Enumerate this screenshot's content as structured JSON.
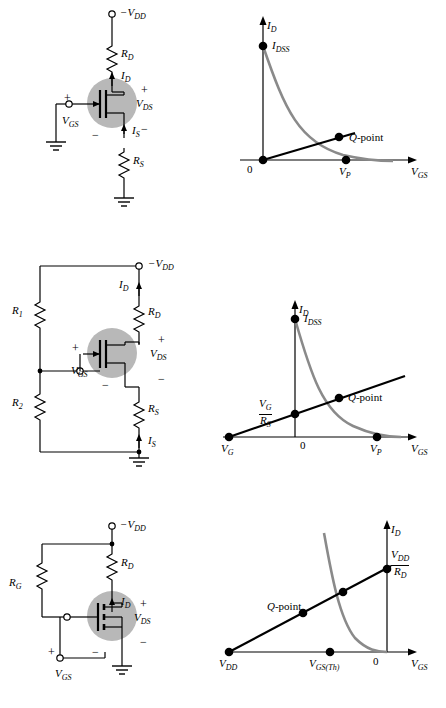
{
  "figure": {
    "rows": [
      {
        "id": "self-bias-jfet",
        "circuit": {
          "name": "self-bias-jfet-circuit",
          "labels": {
            "vdd": "−V",
            "vdd_sub": "DD",
            "rd": "R",
            "rd_sub": "D",
            "rs": "R",
            "rs_sub": "S",
            "id": "I",
            "id_sub": "D",
            "is": "I",
            "is_sub": "S",
            "vds": "V",
            "vds_sub": "DS",
            "vgs": "V",
            "vgs_sub": "GS",
            "plus_top": "+",
            "minus_mid": "−",
            "plus_gs": "+",
            "minus_gs": "−"
          }
        },
        "graph": {
          "name": "self-bias-graph",
          "y_axis": "I",
          "y_axis_sub": "D",
          "x_axis": "V",
          "x_axis_sub": "GS",
          "origin": "0",
          "points": [
            {
              "label": "I",
              "sub": "DSS",
              "name": "idss-label"
            },
            {
              "label": "Q",
              "suffix": "-point",
              "name": "q-point-label"
            },
            {
              "label": "V",
              "sub": "P",
              "name": "vp-label"
            }
          ]
        }
      },
      {
        "id": "voltage-divider-jfet",
        "circuit": {
          "name": "voltage-divider-bias-circuit",
          "labels": {
            "vdd": "−V",
            "vdd_sub": "DD",
            "r1": "R",
            "r1_sub": "1",
            "r2": "R",
            "r2_sub": "2",
            "rd": "R",
            "rd_sub": "D",
            "rs": "R",
            "rs_sub": "S",
            "id": "I",
            "id_sub": "D",
            "is": "I",
            "is_sub": "S",
            "vds": "V",
            "vds_sub": "DS",
            "vgs": "V",
            "vgs_sub": "GS",
            "plus_top": "+",
            "minus_mid": "−",
            "plus_gs": "+",
            "minus_gs": "−"
          }
        },
        "graph": {
          "name": "voltage-divider-graph",
          "y_axis": "I",
          "y_axis_sub": "D",
          "x_axis": "V",
          "x_axis_sub": "GS",
          "origin": "0",
          "points": [
            {
              "label": "I",
              "sub": "DSS",
              "name": "idss-label"
            },
            {
              "label": "Q",
              "suffix": "-point",
              "name": "q-point-label"
            },
            {
              "label": "V",
              "sub": "G",
              "name": "vg-label"
            },
            {
              "label": "V",
              "sub": "P",
              "name": "vp-label"
            }
          ],
          "fraction": {
            "num": "V",
            "num_sub": "G",
            "den": "R",
            "den_sub": "S",
            "name": "vg-over-rs-label"
          }
        }
      },
      {
        "id": "drain-feedback-mosfet",
        "circuit": {
          "name": "drain-feedback-bias-circuit",
          "labels": {
            "vdd": "−V",
            "vdd_sub": "DD",
            "rd": "R",
            "rd_sub": "D",
            "rg": "R",
            "rg_sub": "G",
            "id": "I",
            "id_sub": "D",
            "vds": "V",
            "vds_sub": "DS",
            "vgs": "V",
            "vgs_sub": "GS",
            "plus_top": "+",
            "minus_mid": "−",
            "plus_gs": "+",
            "minus_gs": "−"
          }
        },
        "graph": {
          "name": "drain-feedback-graph",
          "y_axis": "I",
          "y_axis_sub": "D",
          "x_axis": "V",
          "x_axis_sub": "GS",
          "origin": "0",
          "points": [
            {
              "label": "Q",
              "suffix": "-point",
              "name": "q-point-label"
            },
            {
              "label": "V",
              "sub": "DD",
              "name": "vdd-label"
            },
            {
              "label": "V",
              "sub": "GS(Th)",
              "name": "vgsth-label"
            }
          ],
          "fraction": {
            "num": "V",
            "num_sub": "DD",
            "den": "R",
            "den_sub": "D",
            "name": "vdd-over-rd-label"
          }
        }
      }
    ],
    "colors": {
      "line": "#000000",
      "curve": "#808080",
      "transistor_halo": "#b3b3b3",
      "background": "#ffffff"
    }
  }
}
